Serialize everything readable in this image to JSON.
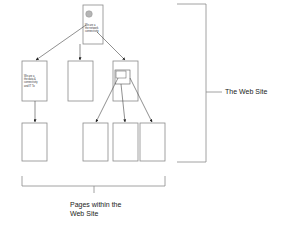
{
  "diagram": {
    "type": "site-hierarchy",
    "nodes": {
      "home": {
        "label_lines": [
          "We are a",
          "the network",
          "connectivity"
        ],
        "has_image": true
      },
      "level2": [
        {
          "id": "page-left",
          "label_lines": [
            "We are a",
            "the data &",
            "connectivity",
            "and IT To"
          ]
        },
        {
          "id": "page-middle",
          "label_lines": []
        },
        {
          "id": "page-right",
          "label_lines": [],
          "has_nested_frame": true
        }
      ],
      "level3": [
        {
          "id": "sub-left"
        },
        {
          "id": "sub-a"
        },
        {
          "id": "sub-b"
        },
        {
          "id": "sub-c"
        }
      ]
    },
    "labels": {
      "web_site": "The Web Site",
      "pages_line1": "Pages within the",
      "pages_line2": "Web Site"
    },
    "colors": {
      "stroke": "#8a8a8a",
      "arrow": "#222222",
      "image_fill": "#b5b5b5",
      "text": "#222222"
    }
  }
}
